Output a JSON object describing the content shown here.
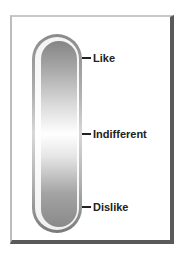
{
  "diagram": {
    "type": "thermometer-scale",
    "labels": {
      "top": "Like",
      "middle": "Indifferent",
      "bottom": "Dislike"
    },
    "colors": {
      "frame_dark": "#5a5a5a",
      "frame_light": "#c8c8c8",
      "tube_gray": "#8a8a8a",
      "text": "#222222"
    }
  }
}
